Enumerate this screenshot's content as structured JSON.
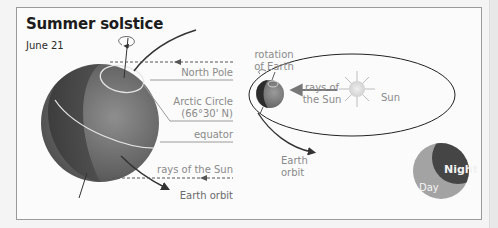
{
  "title": "Summer solstice",
  "subtitle": "June 21",
  "left_diagram": {
    "labels": {
      "north_pole": "North Pole",
      "arctic_circle_line1": "Arctic Circle",
      "arctic_circle_line2": "(66°30' N)",
      "equator": "equator",
      "rays": "rays of the Sun",
      "orbit": "Earth orbit"
    }
  },
  "right_diagram": {
    "labels": {
      "rotation_line1": "rotation",
      "rotation_line2": "of Earth",
      "rays_line1": "rays of",
      "rays_line2": "the Sun",
      "sun": "Sun",
      "orbit_line1": "Earth",
      "orbit_line2": "orbit"
    }
  },
  "legend": {
    "night": "Night",
    "day": "Day"
  },
  "colors": {
    "globe_dark": "#3a3a3a",
    "globe_mid": "#6e6e6e",
    "globe_light": "#8c8c8c",
    "label_gray": "#8a8a8a",
    "line_dark": "#333333",
    "sun": "#dcdcdc",
    "night_fill": "#454545",
    "day_fill": "#a3a3a3"
  }
}
